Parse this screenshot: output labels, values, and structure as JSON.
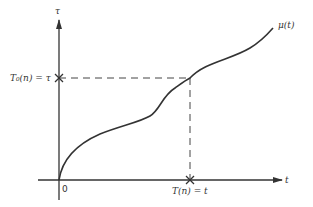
{
  "diagram": {
    "y_axis_label": "τ",
    "x_axis_label": "t",
    "curve_label": "μ(t)",
    "origin_label": "0",
    "y_marker_label": "T₀(n) = τ",
    "x_marker_label": "T(n) = t",
    "line_color": "#333333"
  }
}
